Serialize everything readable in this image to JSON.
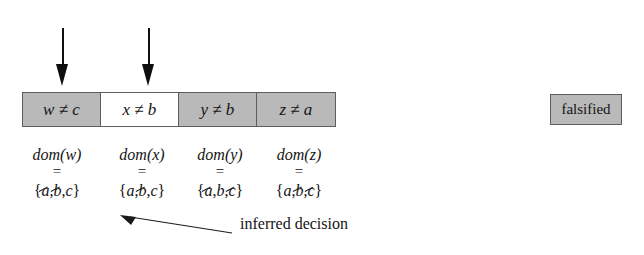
{
  "figure": {
    "constraints": {
      "cells": [
        {
          "var": "w",
          "rel": "≠",
          "val": "c",
          "state": "falsified"
        },
        {
          "var": "x",
          "rel": "≠",
          "val": "b",
          "state": "satisfied"
        },
        {
          "var": "y",
          "rel": "≠",
          "val": "b",
          "state": "falsified"
        },
        {
          "var": "z",
          "rel": "≠",
          "val": "a",
          "state": "falsified"
        }
      ]
    },
    "legend": {
      "falsified_label": "falsified"
    },
    "arrows": {
      "down_arrow_1": "down-arrow",
      "down_arrow_2": "down-arrow",
      "annotation_arrow": "arrow-up-left"
    },
    "domains": [
      {
        "label": "dom(w)",
        "eq": "=",
        "open": "{",
        "close": "}",
        "elements": [
          {
            "text": "a",
            "struck": true
          },
          {
            "text": "b",
            "struck": true
          },
          {
            "text": "c",
            "struck": false
          }
        ]
      },
      {
        "label": "dom(x)",
        "eq": "=",
        "open": "{",
        "close": "}",
        "elements": [
          {
            "text": "a",
            "struck": false
          },
          {
            "text": "b",
            "struck": true
          },
          {
            "text": "c",
            "struck": false
          }
        ]
      },
      {
        "label": "dom(y)",
        "eq": "=",
        "open": "{",
        "close": "}",
        "elements": [
          {
            "text": "a",
            "struck": true
          },
          {
            "text": "b",
            "struck": false
          },
          {
            "text": "c",
            "struck": true
          }
        ]
      },
      {
        "label": "dom(z)",
        "eq": "=",
        "open": "{",
        "close": "}",
        "elements": [
          {
            "text": "a",
            "struck": false
          },
          {
            "text": "b",
            "struck": true
          },
          {
            "text": "c",
            "struck": true
          }
        ]
      }
    ],
    "annotation": {
      "text": "inferred decision"
    },
    "colors": {
      "falsified_fill": "#b9b9b9",
      "satisfied_fill": "#ffffff",
      "border": "#5d5d5d",
      "ink": "#141414"
    }
  }
}
